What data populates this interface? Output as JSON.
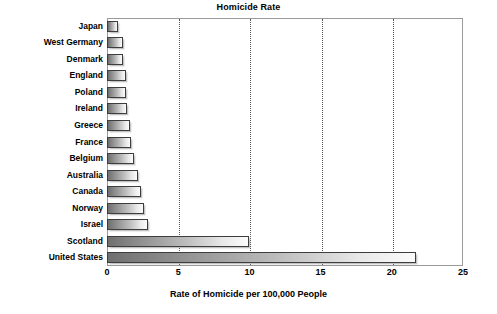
{
  "chart_data": {
    "type": "bar",
    "orientation": "horizontal",
    "title": "Homicide Rate",
    "xlabel": "Rate of Homicide per 100,000 People",
    "ylabel": "",
    "xlim": [
      0,
      25
    ],
    "xticks": [
      0,
      5,
      10,
      15,
      20,
      25
    ],
    "xtick_labels": [
      "0",
      "5",
      "10",
      "15",
      "20",
      "25"
    ],
    "grid": true,
    "grid_axis": "x",
    "grid_style": "dotted",
    "legend": false,
    "categories": [
      "Japan",
      "West Germany",
      "Denmark",
      "England",
      "Poland",
      "Ireland",
      "Greece",
      "France",
      "Belgium",
      "Australia",
      "Canada",
      "Norway",
      "Israel",
      "Scotland",
      "United States"
    ],
    "values": [
      0.8,
      1.1,
      1.1,
      1.3,
      1.3,
      1.4,
      1.6,
      1.7,
      1.9,
      2.2,
      2.4,
      2.6,
      2.9,
      10.0,
      21.7
    ],
    "bar_fill": "linear-gradient-gray-dark-to-light",
    "bar_border_color": "#3d3d3d",
    "plot_border_color": "#9a9a9a",
    "background_color": "#ffffff",
    "text_color": "#000000"
  }
}
